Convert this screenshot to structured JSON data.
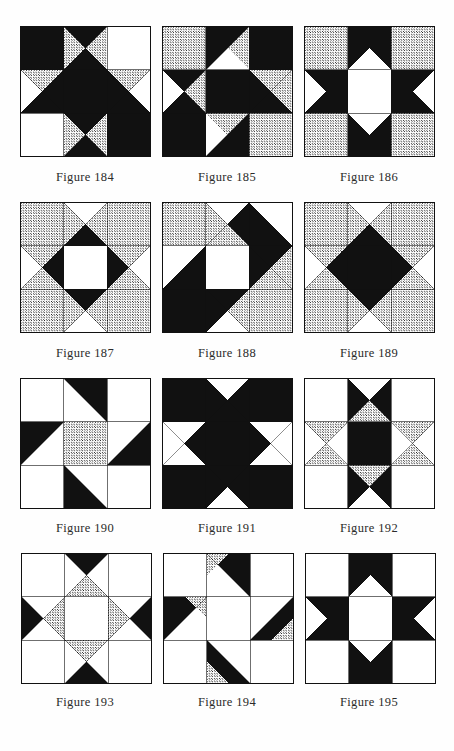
{
  "page": {
    "background_color": "#fefefe",
    "ink_color": "#111111",
    "stipple_color": "#111111",
    "light_color": "#ffffff",
    "columns": 3,
    "rows": 4
  },
  "legend": {
    "fills": {
      "dark": "solid black",
      "light": "plain white",
      "stipple": "dotted/stippled gray"
    }
  },
  "figures": [
    {
      "caption": "Figure 184",
      "number": "184",
      "grid": 3,
      "name": "nine-patch-hourglass-dark",
      "cells": [
        {
          "r": 0,
          "c": 0,
          "type": "solid",
          "fill": "dark"
        },
        {
          "r": 0,
          "c": 1,
          "type": "hourglass_v",
          "top": "dark",
          "bottom": "dark",
          "left": "stipple",
          "right": "stipple"
        },
        {
          "r": 0,
          "c": 2,
          "type": "solid",
          "fill": "light"
        },
        {
          "r": 1,
          "c": 0,
          "type": "hourglass_h",
          "top": "stipple",
          "bottom": "dark",
          "left": "light",
          "right": "dark"
        },
        {
          "r": 1,
          "c": 1,
          "type": "solid",
          "fill": "dark"
        },
        {
          "r": 1,
          "c": 2,
          "type": "hourglass_h",
          "top": "stipple",
          "bottom": "dark",
          "left": "dark",
          "right": "light"
        },
        {
          "r": 2,
          "c": 0,
          "type": "solid",
          "fill": "light"
        },
        {
          "r": 2,
          "c": 1,
          "type": "hourglass_v",
          "top": "dark",
          "bottom": "dark",
          "left": "stipple",
          "right": "stipple"
        },
        {
          "r": 2,
          "c": 2,
          "type": "solid",
          "fill": "dark"
        }
      ]
    },
    {
      "caption": "Figure 185",
      "number": "185",
      "grid": 3,
      "name": "diagonal-dark-band-star",
      "cells": [
        {
          "r": 0,
          "c": 0,
          "type": "solid",
          "fill": "stipple"
        },
        {
          "r": 0,
          "c": 1,
          "type": "diag_tri",
          "orient": "tl",
          "a": "dark",
          "b": "light",
          "extra": "stipple_tr"
        },
        {
          "r": 0,
          "c": 2,
          "type": "solid",
          "fill": "dark"
        },
        {
          "r": 1,
          "c": 0,
          "type": "hourglass_h",
          "top": "dark",
          "bottom": "dark",
          "left": "light",
          "right": "stipple"
        },
        {
          "r": 1,
          "c": 1,
          "type": "solid",
          "fill": "dark"
        },
        {
          "r": 1,
          "c": 2,
          "type": "hourglass_h",
          "top": "stipple",
          "bottom": "dark",
          "left": "dark",
          "right": "stipple"
        },
        {
          "r": 2,
          "c": 0,
          "type": "solid",
          "fill": "dark"
        },
        {
          "r": 2,
          "c": 1,
          "type": "diag_tri",
          "orient": "br",
          "a": "dark",
          "b": "stipple",
          "extra": "light_bl"
        },
        {
          "r": 2,
          "c": 2,
          "type": "solid",
          "fill": "stipple"
        }
      ]
    },
    {
      "caption": "Figure 186",
      "number": "186",
      "grid": 3,
      "name": "bowtie-star-white-center",
      "cells": [
        {
          "r": 0,
          "c": 0,
          "type": "solid",
          "fill": "stipple"
        },
        {
          "r": 0,
          "c": 1,
          "type": "bowtie_v",
          "fill": "dark",
          "bg": "light"
        },
        {
          "r": 0,
          "c": 2,
          "type": "solid",
          "fill": "stipple"
        },
        {
          "r": 1,
          "c": 0,
          "type": "bowtie_h",
          "fill": "dark",
          "bg": "light"
        },
        {
          "r": 1,
          "c": 1,
          "type": "solid",
          "fill": "light"
        },
        {
          "r": 1,
          "c": 2,
          "type": "bowtie_h_rev",
          "fill": "dark",
          "bg": "light"
        },
        {
          "r": 2,
          "c": 0,
          "type": "solid",
          "fill": "stipple"
        },
        {
          "r": 2,
          "c": 1,
          "type": "bowtie_v_rev",
          "fill": "dark",
          "bg": "light"
        },
        {
          "r": 2,
          "c": 2,
          "type": "solid",
          "fill": "stipple"
        }
      ]
    },
    {
      "caption": "Figure 187",
      "number": "187",
      "grid": 3,
      "name": "ohio-star-stipple-dark-diamond",
      "cells": [
        {
          "r": 0,
          "c": 0,
          "type": "solid",
          "fill": "stipple"
        },
        {
          "r": 0,
          "c": 1,
          "type": "hourglass_v",
          "top": "light",
          "bottom": "dark",
          "left": "stipple",
          "right": "stipple"
        },
        {
          "r": 0,
          "c": 2,
          "type": "solid",
          "fill": "stipple"
        },
        {
          "r": 1,
          "c": 0,
          "type": "hourglass_h",
          "top": "stipple",
          "bottom": "stipple",
          "left": "light",
          "right": "dark"
        },
        {
          "r": 1,
          "c": 1,
          "type": "solid",
          "fill": "light"
        },
        {
          "r": 1,
          "c": 2,
          "type": "hourglass_h",
          "top": "stipple",
          "bottom": "stipple",
          "left": "dark",
          "right": "light"
        },
        {
          "r": 2,
          "c": 0,
          "type": "solid",
          "fill": "stipple"
        },
        {
          "r": 2,
          "c": 1,
          "type": "hourglass_v",
          "top": "dark",
          "bottom": "light",
          "left": "stipple",
          "right": "stipple"
        },
        {
          "r": 2,
          "c": 2,
          "type": "solid",
          "fill": "stipple"
        }
      ]
    },
    {
      "caption": "Figure 188",
      "number": "188",
      "grid": 3,
      "name": "diagonal-dark-sash-white-center",
      "cells": [
        {
          "r": 0,
          "c": 0,
          "type": "solid",
          "fill": "stipple"
        },
        {
          "r": 0,
          "c": 1,
          "type": "hourglass_v",
          "top": "light",
          "bottom": "stipple",
          "left": "stipple",
          "right": "dark"
        },
        {
          "r": 0,
          "c": 2,
          "type": "diag_tri",
          "orient": "bl",
          "a": "dark",
          "b": "light"
        },
        {
          "r": 1,
          "c": 0,
          "type": "diag_tri",
          "orient": "br",
          "a": "dark",
          "b": "light"
        },
        {
          "r": 1,
          "c": 1,
          "type": "solid",
          "fill": "light"
        },
        {
          "r": 1,
          "c": 2,
          "type": "hourglass_h",
          "top": "dark",
          "bottom": "stipple",
          "left": "dark",
          "right": "stipple"
        },
        {
          "r": 2,
          "c": 0,
          "type": "solid",
          "fill": "dark"
        },
        {
          "r": 2,
          "c": 1,
          "type": "hourglass_v",
          "top": "dark",
          "bottom": "light",
          "left": "dark",
          "right": "stipple"
        },
        {
          "r": 2,
          "c": 2,
          "type": "solid",
          "fill": "stipple"
        }
      ]
    },
    {
      "caption": "Figure 189",
      "number": "189",
      "grid": 3,
      "name": "big-dark-star-on-stipple",
      "cells": [
        {
          "r": 0,
          "c": 0,
          "type": "solid",
          "fill": "stipple"
        },
        {
          "r": 0,
          "c": 1,
          "type": "hourglass_v",
          "top": "light",
          "bottom": "dark",
          "left": "stipple",
          "right": "stipple"
        },
        {
          "r": 0,
          "c": 2,
          "type": "solid",
          "fill": "stipple"
        },
        {
          "r": 1,
          "c": 0,
          "type": "hourglass_h",
          "top": "stipple",
          "bottom": "stipple",
          "left": "light",
          "right": "dark"
        },
        {
          "r": 1,
          "c": 1,
          "type": "solid",
          "fill": "dark"
        },
        {
          "r": 1,
          "c": 2,
          "type": "hourglass_h",
          "top": "stipple",
          "bottom": "stipple",
          "left": "dark",
          "right": "light"
        },
        {
          "r": 2,
          "c": 0,
          "type": "solid",
          "fill": "stipple"
        },
        {
          "r": 2,
          "c": 1,
          "type": "hourglass_v",
          "top": "dark",
          "bottom": "light",
          "left": "stipple",
          "right": "stipple"
        },
        {
          "r": 2,
          "c": 2,
          "type": "solid",
          "fill": "stipple"
        }
      ]
    },
    {
      "caption": "Figure 190",
      "number": "190",
      "grid": 3,
      "name": "pinwheel-dark-stipple-center",
      "cells": [
        {
          "r": 0,
          "c": 0,
          "type": "solid",
          "fill": "light"
        },
        {
          "r": 0,
          "c": 1,
          "type": "diag_tri",
          "orient": "tr",
          "a": "dark",
          "b": "light"
        },
        {
          "r": 0,
          "c": 2,
          "type": "solid",
          "fill": "light"
        },
        {
          "r": 1,
          "c": 0,
          "type": "diag_tri",
          "orient": "tl",
          "a": "dark",
          "b": "light"
        },
        {
          "r": 1,
          "c": 1,
          "type": "solid",
          "fill": "stipple"
        },
        {
          "r": 1,
          "c": 2,
          "type": "diag_tri",
          "orient": "br",
          "a": "dark",
          "b": "light"
        },
        {
          "r": 2,
          "c": 0,
          "type": "solid",
          "fill": "light"
        },
        {
          "r": 2,
          "c": 1,
          "type": "diag_tri",
          "orient": "bl",
          "a": "dark",
          "b": "light"
        },
        {
          "r": 2,
          "c": 2,
          "type": "solid",
          "fill": "light"
        }
      ]
    },
    {
      "caption": "Figure 191",
      "number": "191",
      "grid": 3,
      "name": "dark-ohio-star-white-points",
      "cells": [
        {
          "r": 0,
          "c": 0,
          "type": "solid",
          "fill": "dark"
        },
        {
          "r": 0,
          "c": 1,
          "type": "hourglass_v",
          "top": "light",
          "bottom": "dark",
          "left": "dark",
          "right": "dark"
        },
        {
          "r": 0,
          "c": 2,
          "type": "solid",
          "fill": "dark"
        },
        {
          "r": 1,
          "c": 0,
          "type": "hourglass_h",
          "top": "light",
          "bottom": "light",
          "left": "light",
          "right": "dark"
        },
        {
          "r": 1,
          "c": 1,
          "type": "solid",
          "fill": "dark"
        },
        {
          "r": 1,
          "c": 2,
          "type": "hourglass_h",
          "top": "light",
          "bottom": "light",
          "left": "dark",
          "right": "light"
        },
        {
          "r": 2,
          "c": 0,
          "type": "solid",
          "fill": "dark"
        },
        {
          "r": 2,
          "c": 1,
          "type": "hourglass_v",
          "top": "dark",
          "bottom": "light",
          "left": "dark",
          "right": "dark"
        },
        {
          "r": 2,
          "c": 2,
          "type": "solid",
          "fill": "dark"
        }
      ]
    },
    {
      "caption": "Figure 192",
      "number": "192",
      "grid": 3,
      "name": "cross-dark-bar-stipple-hourglass",
      "cells": [
        {
          "r": 0,
          "c": 0,
          "type": "solid",
          "fill": "light"
        },
        {
          "r": 0,
          "c": 1,
          "type": "hourglass_v",
          "top": "light",
          "bottom": "stipple",
          "left": "dark",
          "right": "dark"
        },
        {
          "r": 0,
          "c": 2,
          "type": "solid",
          "fill": "light"
        },
        {
          "r": 1,
          "c": 0,
          "type": "hourglass_h",
          "top": "stipple",
          "bottom": "stipple",
          "left": "light",
          "right": "light"
        },
        {
          "r": 1,
          "c": 1,
          "type": "solid",
          "fill": "dark"
        },
        {
          "r": 1,
          "c": 2,
          "type": "hourglass_h",
          "top": "stipple",
          "bottom": "stipple",
          "left": "light",
          "right": "light"
        },
        {
          "r": 2,
          "c": 0,
          "type": "solid",
          "fill": "light"
        },
        {
          "r": 2,
          "c": 1,
          "type": "hourglass_v",
          "top": "stipple",
          "bottom": "light",
          "left": "dark",
          "right": "dark"
        },
        {
          "r": 2,
          "c": 2,
          "type": "solid",
          "fill": "light"
        }
      ]
    },
    {
      "caption": "Figure 193",
      "number": "193",
      "grid": 3,
      "name": "star-white-center-stipple-ring",
      "cells": [
        {
          "r": 0,
          "c": 0,
          "type": "solid",
          "fill": "light"
        },
        {
          "r": 0,
          "c": 1,
          "type": "hourglass_v",
          "top": "dark",
          "bottom": "stipple",
          "left": "light",
          "right": "light"
        },
        {
          "r": 0,
          "c": 2,
          "type": "solid",
          "fill": "light"
        },
        {
          "r": 1,
          "c": 0,
          "type": "hourglass_h",
          "top": "light",
          "bottom": "light",
          "left": "dark",
          "right": "stipple"
        },
        {
          "r": 1,
          "c": 1,
          "type": "solid",
          "fill": "light"
        },
        {
          "r": 1,
          "c": 2,
          "type": "hourglass_h",
          "top": "light",
          "bottom": "light",
          "left": "stipple",
          "right": "dark"
        },
        {
          "r": 2,
          "c": 0,
          "type": "solid",
          "fill": "light"
        },
        {
          "r": 2,
          "c": 1,
          "type": "hourglass_v",
          "top": "stipple",
          "bottom": "dark",
          "left": "light",
          "right": "light"
        },
        {
          "r": 2,
          "c": 2,
          "type": "solid",
          "fill": "light"
        }
      ]
    },
    {
      "caption": "Figure 194",
      "number": "194",
      "grid": 3,
      "name": "pinwheel-dark-stipple-triangles",
      "cells": [
        {
          "r": 0,
          "c": 0,
          "type": "solid",
          "fill": "light"
        },
        {
          "r": 0,
          "c": 1,
          "type": "split_tri3",
          "orient": "tr",
          "a": "dark",
          "b": "stipple",
          "c2": "light"
        },
        {
          "r": 0,
          "c": 2,
          "type": "solid",
          "fill": "light"
        },
        {
          "r": 1,
          "c": 0,
          "type": "split_tri3",
          "orient": "tl",
          "a": "dark",
          "b": "stipple",
          "c2": "light"
        },
        {
          "r": 1,
          "c": 1,
          "type": "solid",
          "fill": "light"
        },
        {
          "r": 1,
          "c": 2,
          "type": "split_tri3",
          "orient": "br",
          "a": "dark",
          "b": "stipple",
          "c2": "light"
        },
        {
          "r": 2,
          "c": 0,
          "type": "solid",
          "fill": "light"
        },
        {
          "r": 2,
          "c": 1,
          "type": "split_tri3",
          "orient": "bl",
          "a": "dark",
          "b": "stipple",
          "c2": "light"
        },
        {
          "r": 2,
          "c": 2,
          "type": "solid",
          "fill": "light"
        }
      ]
    },
    {
      "caption": "Figure 195",
      "number": "195",
      "grid": 3,
      "name": "dark-cross-notched-arrows",
      "cells": [
        {
          "r": 0,
          "c": 0,
          "type": "solid",
          "fill": "light"
        },
        {
          "r": 0,
          "c": 1,
          "type": "notch",
          "dir": "down",
          "fill": "dark",
          "bg": "light"
        },
        {
          "r": 0,
          "c": 2,
          "type": "solid",
          "fill": "light"
        },
        {
          "r": 1,
          "c": 0,
          "type": "notch",
          "dir": "right",
          "fill": "dark",
          "bg": "light"
        },
        {
          "r": 1,
          "c": 1,
          "type": "solid",
          "fill": "light"
        },
        {
          "r": 1,
          "c": 2,
          "type": "notch",
          "dir": "left",
          "fill": "dark",
          "bg": "light"
        },
        {
          "r": 2,
          "c": 0,
          "type": "solid",
          "fill": "light"
        },
        {
          "r": 2,
          "c": 1,
          "type": "notch",
          "dir": "up",
          "fill": "dark",
          "bg": "light"
        },
        {
          "r": 2,
          "c": 2,
          "type": "solid",
          "fill": "light"
        }
      ]
    }
  ]
}
